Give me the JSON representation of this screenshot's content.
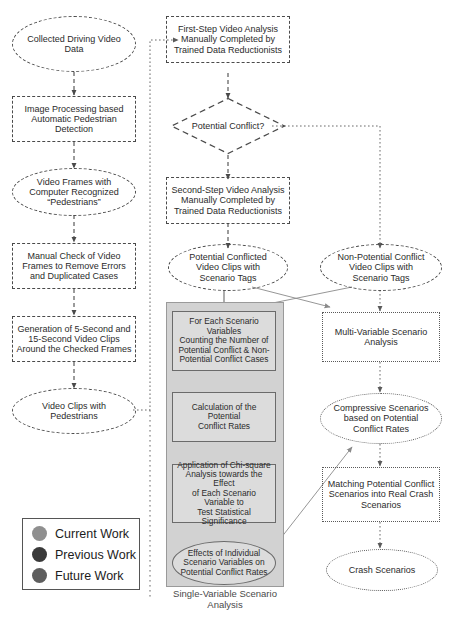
{
  "diagram": {
    "group_caption": "Single-Variable Scenario\nAnalysis"
  },
  "nodes": {
    "collected_driving_video_data": "Collected Driving Video\nData",
    "image_processing": "Image Processing based\nAutomatic Pedestrian\nDetection",
    "video_frames_recognized": "Video Frames with\nComputer Recognized\n“Pedestrians”",
    "manual_check": "Manual Check of Video\nFrames to Remove Errors\nand Duplicated Cases",
    "generation_clips": "Generation of 5-Second and\n15-Second Video Clips\nAround the Checked Frames",
    "video_clips_pedestrians": "Video Clips with\nPedestrians",
    "first_step_analysis": "First-Step Video Analysis\nManually Completed by\nTrained Data Reductionists",
    "potential_conflict_decision": "Potential Conflict?",
    "second_step_analysis": "Second-Step Video Analysis\nManually Completed by\nTrained Data Reductionists",
    "potential_conflicted_clips": "Potential Conflicted\nVideo Clips with\nScenario Tags",
    "non_potential_conflict_clips": "Non-Potential Conflict\nVideo Clips with\nScenario Tags",
    "counting_cases": "For Each Scenario Variables\nCounting the Number of\nPotential Conflict & Non-\nPotential Conflict Cases",
    "calculation_rates": "Calculation of the Potential\nConflict Rates",
    "chi_square": "Application of Chi-square\nAnalysis towards the Effect\nof Each Scenario Variable to\nTest Statistical Significance",
    "effects_individual": "Effects of Individual\nScenario Variables on\nPotential Conflict Rates",
    "multi_variable_analysis": "Multi-Variable Scenario\nAnalysis",
    "compressive_scenarios": "Compressive Scenarios\nbased on Potential\nConflict Rates",
    "matching_scenarios": "Matching Potential Conflict\nScenarios into Real Crash\nScenarios",
    "crash_scenarios": "Crash Scenarios"
  },
  "legend": {
    "items": [
      {
        "label": "Current Work",
        "color": "#8f8f8f"
      },
      {
        "label": "Previous Work",
        "color": "#3a3a3a"
      },
      {
        "label": "Future Work",
        "color": "#5e5e5e"
      }
    ]
  }
}
